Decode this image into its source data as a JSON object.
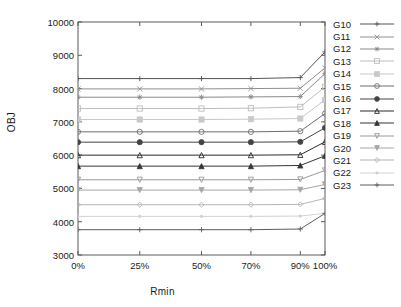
{
  "chart_data": {
    "type": "line",
    "title": "",
    "xlabel": "Rmin",
    "ylabel": "OBJ",
    "categories": [
      "0%",
      "25%",
      "50%",
      "70%",
      "90%",
      "100%"
    ],
    "x": [
      0,
      25,
      50,
      70,
      90,
      100
    ],
    "xlim": [
      0,
      100
    ],
    "ylim": [
      3000,
      10000
    ],
    "yticks": [
      3000,
      4000,
      5000,
      6000,
      7000,
      8000,
      9000,
      10000
    ],
    "grid": false,
    "legend_position": "right",
    "series": [
      {
        "name": "G10",
        "marker": "plus",
        "color": "#555555",
        "values": [
          8300,
          8300,
          8300,
          8300,
          8330,
          9100
        ]
      },
      {
        "name": "G11",
        "marker": "cross",
        "color": "#909090",
        "values": [
          7990,
          7990,
          7990,
          8000,
          8010,
          8620
        ]
      },
      {
        "name": "G12",
        "marker": "star",
        "color": "#8a8a8a",
        "values": [
          7740,
          7740,
          7740,
          7750,
          7760,
          8450
        ]
      },
      {
        "name": "G13",
        "marker": "square-open",
        "color": "#bdbdbd",
        "values": [
          7400,
          7400,
          7400,
          7410,
          7450,
          8050
        ]
      },
      {
        "name": "G14",
        "marker": "square-fill",
        "color": "#c9c9c9",
        "values": [
          7070,
          7070,
          7070,
          7080,
          7100,
          7660
        ]
      },
      {
        "name": "G15",
        "marker": "circle-open",
        "color": "#6f6f6f",
        "values": [
          6700,
          6700,
          6700,
          6700,
          6720,
          7250
        ]
      },
      {
        "name": "G16",
        "marker": "circle-fill",
        "color": "#444444",
        "values": [
          6390,
          6390,
          6390,
          6390,
          6400,
          6820
        ]
      },
      {
        "name": "G17",
        "marker": "tri-open",
        "color": "#2b2b2b",
        "values": [
          6000,
          6000,
          6000,
          6000,
          6010,
          6400
        ]
      },
      {
        "name": "G18",
        "marker": "tri-fill",
        "color": "#353535",
        "values": [
          5670,
          5670,
          5670,
          5670,
          5690,
          5980
        ]
      },
      {
        "name": "G19",
        "marker": "dtri-open",
        "color": "#9a9a9a",
        "values": [
          5260,
          5260,
          5260,
          5260,
          5270,
          5540
        ]
      },
      {
        "name": "G20",
        "marker": "dtri-fill",
        "color": "#a5a5a5",
        "values": [
          4950,
          4950,
          4950,
          4950,
          4960,
          5120
        ]
      },
      {
        "name": "G21",
        "marker": "diamond",
        "color": "#b5b5b5",
        "values": [
          4510,
          4510,
          4510,
          4510,
          4520,
          4700
        ]
      },
      {
        "name": "G22",
        "marker": "dot",
        "color": "#d2d2d2",
        "values": [
          4160,
          4160,
          4160,
          4160,
          4170,
          4250
        ]
      },
      {
        "name": "G23",
        "marker": "plus",
        "color": "#5d5d5d",
        "values": [
          3760,
          3760,
          3760,
          3760,
          3780,
          4250
        ]
      }
    ]
  }
}
